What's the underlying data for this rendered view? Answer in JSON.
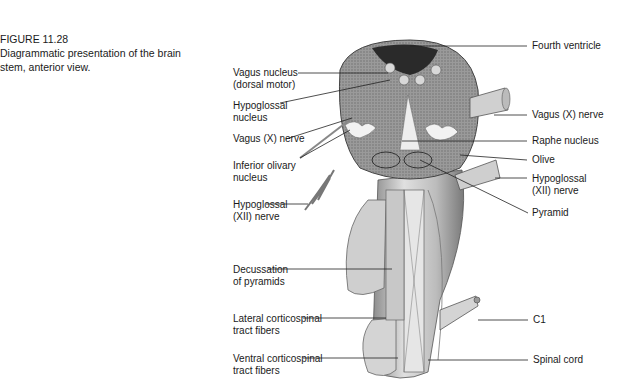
{
  "caption": {
    "figure_number": "FIGURE 11.28",
    "line1": "Diagrammatic presentation of the brain",
    "line2": "stem, anterior view."
  },
  "labels_left": [
    {
      "id": "vagus-nucleus",
      "lines": [
        "Vagus nucleus",
        "(dorsal motor)"
      ]
    },
    {
      "id": "hypoglossal-nucleus",
      "lines": [
        "Hypoglossal",
        "nucleus"
      ]
    },
    {
      "id": "vagus-nerve-left",
      "lines": [
        "Vagus (X) nerve"
      ]
    },
    {
      "id": "inferior-olivary-nucleus",
      "lines": [
        "Inferior olivary",
        "nucleus"
      ]
    },
    {
      "id": "hypoglossal-nerve-left",
      "lines": [
        "Hypoglossal",
        "(XII) nerve"
      ]
    },
    {
      "id": "decussation-of-pyramids",
      "lines": [
        "Decussation",
        "of pyramids"
      ]
    },
    {
      "id": "lateral-corticospinal",
      "lines": [
        "Lateral corticospinal",
        "tract fibers"
      ]
    },
    {
      "id": "ventral-corticospinal",
      "lines": [
        "Ventral corticospinal",
        "tract fibers"
      ]
    }
  ],
  "labels_right": [
    {
      "id": "fourth-ventricle",
      "lines": [
        "Fourth ventricle"
      ]
    },
    {
      "id": "vagus-nerve-right",
      "lines": [
        "Vagus (X) nerve"
      ]
    },
    {
      "id": "raphe-nucleus",
      "lines": [
        "Raphe nucleus"
      ]
    },
    {
      "id": "olive",
      "lines": [
        "Olive"
      ]
    },
    {
      "id": "hypoglossal-nerve-right",
      "lines": [
        "Hypoglossal",
        "(XII) nerve"
      ]
    },
    {
      "id": "pyramid",
      "lines": [
        "Pyramid"
      ]
    },
    {
      "id": "c1",
      "lines": [
        "C1"
      ]
    },
    {
      "id": "spinal-cord",
      "lines": [
        "Spinal cord"
      ]
    }
  ]
}
